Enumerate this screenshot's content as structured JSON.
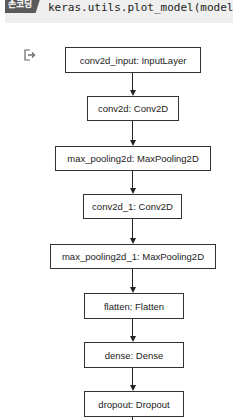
{
  "cell": {
    "tag_label": "손코딩",
    "code": "keras.utils.plot_model(model)",
    "output_icon": "output-redirect-icon"
  },
  "graph": {
    "nodes": [
      {
        "id": "conv2d_input",
        "label": "conv2d_input: InputLayer",
        "x": 65,
        "y": 47,
        "w": 136,
        "h": 26
      },
      {
        "id": "conv2d",
        "label": "conv2d: Conv2D",
        "x": 87,
        "y": 96,
        "w": 92,
        "h": 25
      },
      {
        "id": "max_pooling2d",
        "label": "max_pooling2d: MaxPooling2D",
        "x": 55,
        "y": 146,
        "w": 156,
        "h": 25
      },
      {
        "id": "conv2d_1",
        "label": "conv2d_1: Conv2D",
        "x": 83,
        "y": 194,
        "w": 99,
        "h": 25
      },
      {
        "id": "max_pooling2d_1",
        "label": "max_pooling2d_1: MaxPooling2D",
        "x": 50,
        "y": 244,
        "w": 166,
        "h": 25
      },
      {
        "id": "flatten",
        "label": "flatten: Flatten",
        "x": 84,
        "y": 293,
        "w": 100,
        "h": 26
      },
      {
        "id": "dense",
        "label": "dense: Dense",
        "x": 84,
        "y": 342,
        "w": 100,
        "h": 26
      },
      {
        "id": "dropout",
        "label": "dropout: Dropout",
        "x": 84,
        "y": 391,
        "w": 100,
        "h": 26
      }
    ]
  }
}
